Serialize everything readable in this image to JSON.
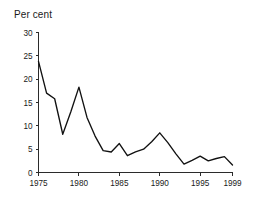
{
  "chart_data": {
    "type": "line",
    "title": "Per cent",
    "xlabel": "",
    "ylabel": "",
    "ylim": [
      0,
      30
    ],
    "xlim": [
      1975,
      1999
    ],
    "yticks": [
      0,
      5,
      10,
      15,
      20,
      25,
      30
    ],
    "ytick_labels": [
      "0",
      "5",
      "10",
      "15",
      "20",
      "25",
      "30"
    ],
    "xticks": [
      1975,
      1980,
      1985,
      1990,
      1995,
      1999
    ],
    "xtick_labels": [
      "1975",
      "1980",
      "1985",
      "1990",
      "1995",
      "1999"
    ],
    "grid": false,
    "legend": false,
    "line_color": "#111111",
    "x": [
      1975,
      1976,
      1977,
      1978,
      1979,
      1980,
      1981,
      1982,
      1983,
      1984,
      1985,
      1986,
      1987,
      1988,
      1989,
      1990,
      1991,
      1992,
      1993,
      1994,
      1995,
      1996,
      1997,
      1998,
      1999
    ],
    "values": [
      23.8,
      17.0,
      15.8,
      8.2,
      13.0,
      18.3,
      11.8,
      7.8,
      4.7,
      4.4,
      6.2,
      3.6,
      4.4,
      5.0,
      6.6,
      8.5,
      6.4,
      4.0,
      1.8,
      2.6,
      3.5,
      2.5,
      3.0,
      3.4,
      1.6
    ],
    "series_name": "Per cent"
  },
  "axes": {
    "y_axis_name": "y-axis",
    "x_axis_name": "x-axis"
  }
}
